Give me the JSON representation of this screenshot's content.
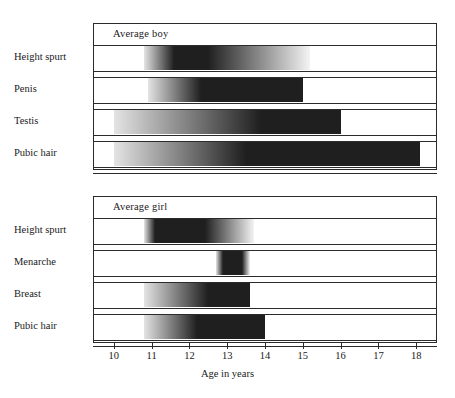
{
  "figure": {
    "axis_title": "Age in years",
    "x_ticks": [
      10,
      11,
      12,
      13,
      14,
      15,
      16,
      17,
      18
    ],
    "x_min": 9.45,
    "x_max": 18.55,
    "ink_color": "#201f1f",
    "frame_color": "#2b2b2b"
  },
  "panels": [
    {
      "id": "boy",
      "title": "Average boy",
      "rows": [
        {
          "label": "Height spurt",
          "start": 10.8,
          "core_start": 11.6,
          "core_end": 12.5,
          "end": 15.2
        },
        {
          "label": "Penis",
          "start": 10.9,
          "core_start": 12.3,
          "core_end": 15.0,
          "end": 15.0
        },
        {
          "label": "Testis",
          "start": 10.0,
          "core_start": 13.9,
          "core_end": 16.0,
          "end": 16.0
        },
        {
          "label": "Pubic hair",
          "start": 10.0,
          "core_start": 13.5,
          "core_end": 18.1,
          "end": 18.1
        }
      ]
    },
    {
      "id": "girl",
      "title": "Average girl",
      "rows": [
        {
          "label": "Height spurt",
          "start": 10.8,
          "core_start": 11.1,
          "core_end": 12.4,
          "end": 13.7
        },
        {
          "label": "Menarche",
          "start": 12.7,
          "core_start": 12.9,
          "core_end": 13.4,
          "end": 13.6
        },
        {
          "label": "Breast",
          "start": 10.8,
          "core_start": 12.5,
          "core_end": 13.6,
          "end": 13.6
        },
        {
          "label": "Pubic hair",
          "start": 10.8,
          "core_start": 12.2,
          "core_end": 14.0,
          "end": 14.0
        }
      ]
    }
  ],
  "chart_data": {
    "type": "bar",
    "title": "",
    "xlabel": "Age in years",
    "ylabel": "",
    "xlim": [
      9.45,
      18.55
    ],
    "grid": false,
    "legend": "none",
    "x_tick_labels": [
      "10",
      "11",
      "12",
      "13",
      "14",
      "15",
      "16",
      "17",
      "18"
    ],
    "note": "Horizontal range bars with stippled (light) onset tails and solid (dark) core intervals, in years of age.",
    "series": [
      {
        "name": "Average boy",
        "categories": [
          "Height spurt",
          "Penis",
          "Testis",
          "Pubic hair"
        ],
        "ranges": [
          {
            "category": "Height spurt",
            "range_start": 10.8,
            "solid_start": 11.6,
            "solid_end": 12.5,
            "range_end": 15.2
          },
          {
            "category": "Penis",
            "range_start": 10.9,
            "solid_start": 12.3,
            "solid_end": 15.0,
            "range_end": 15.0
          },
          {
            "category": "Testis",
            "range_start": 10.0,
            "solid_start": 13.9,
            "solid_end": 16.0,
            "range_end": 16.0
          },
          {
            "category": "Pubic hair",
            "range_start": 10.0,
            "solid_start": 13.5,
            "solid_end": 18.1,
            "range_end": 18.1
          }
        ]
      },
      {
        "name": "Average girl",
        "categories": [
          "Height spurt",
          "Menarche",
          "Breast",
          "Pubic hair"
        ],
        "ranges": [
          {
            "category": "Height spurt",
            "range_start": 10.8,
            "solid_start": 11.1,
            "solid_end": 12.4,
            "range_end": 13.7
          },
          {
            "category": "Menarche",
            "range_start": 12.7,
            "solid_start": 12.9,
            "solid_end": 13.4,
            "range_end": 13.6
          },
          {
            "category": "Breast",
            "range_start": 10.8,
            "solid_start": 12.5,
            "solid_end": 13.6,
            "range_end": 13.6
          },
          {
            "category": "Pubic hair",
            "range_start": 10.8,
            "solid_start": 12.2,
            "solid_end": 14.0,
            "range_end": 14.0
          }
        ]
      }
    ]
  }
}
